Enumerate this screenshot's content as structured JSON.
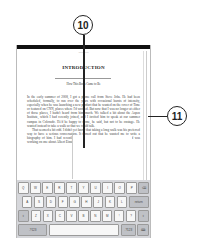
{
  "callouts": [
    {
      "id": "10",
      "label": "10"
    },
    {
      "id": "11",
      "label": "11"
    }
  ],
  "reader": {
    "running_head": "Introduction",
    "chapter_title": "INTRODUCTION",
    "subtitle": "How This Book Came to Be",
    "paragraphs": [
      "In the early summer of 2008, I got a phone call from Steve Jobs. He had been scheduled, formally, to run over the years with occasional bursts of intensity, especially when he was launching a new product that he wanted on the cover of Time or featured on CNN, places where I'd worked. But now that I was no longer at either of those places, I hadn't heard from him much. We talked a bit about the Aspen Institute, which I had recently joined, and I invited him to speak at our summer campus in Colorado. He'd be happy to come, he said, but not to be onstage. He wanted instead to take a walk so that we could talk.",
      "That seemed a bit odd. I didn't yet know that taking a long walk was his preferred way to have a serious conversation. It turned out that he wanted me to write a biography of him. I had recently published one on Benjamin Franklin and was working on one about Albert Einstein."
    ]
  },
  "keyboard": {
    "rows": [
      [
        "Q",
        "W",
        "E",
        "R",
        "T",
        "Y",
        "U",
        "I",
        "O",
        "P",
        "delete"
      ],
      [
        "A",
        "S",
        "D",
        "F",
        "G",
        "H",
        "J",
        "K",
        "L",
        "return"
      ],
      [
        "shift",
        "Z",
        "X",
        "C",
        "V",
        "B",
        "N",
        "M",
        "!",
        "?",
        "shift"
      ],
      [
        ".?123",
        "space",
        ".?123",
        "hide-keyboard"
      ]
    ],
    "labels": {
      "delete": "⌫",
      "return": "return",
      "shift": "⇧",
      "numbers": ".?123",
      "space": "",
      "hide": "⌨"
    }
  }
}
